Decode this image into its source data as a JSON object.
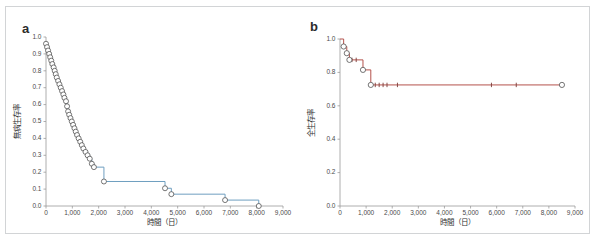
{
  "figure": {
    "panels": [
      {
        "letter": "a",
        "xlabel": "時間（日）",
        "ylabel": "無病生存率"
      },
      {
        "letter": "b",
        "xlabel": "時間（日）",
        "ylabel": "全生存率"
      }
    ]
  },
  "colors": {
    "panel_a_curve": "#6f9fc0",
    "panel_b_curve": "#b4524c",
    "axis": "#9a9a9a",
    "marker_edge": "#4a4a4a",
    "card_border": "#d2d4d6",
    "background": "#ffffff"
  },
  "chart_data": [
    {
      "type": "line",
      "title": "a",
      "subtitle": "Kaplan-Meier disease-free survival curve",
      "xlabel": "時間（日）",
      "ylabel": "無病生存率",
      "xlim": [
        0,
        9000
      ],
      "ylim": [
        0.0,
        1.0
      ],
      "xticks": [
        0,
        1000,
        2000,
        3000,
        4000,
        5000,
        6000,
        7000,
        8000,
        9000
      ],
      "xticklabels": [
        "0",
        "1,000",
        "2,000",
        "3,000",
        "4,000",
        "5,000",
        "6,000",
        "7,000",
        "8,000",
        "9,000"
      ],
      "yticks": [
        0.0,
        0.1,
        0.2,
        0.3,
        0.4,
        0.5,
        0.6,
        0.7,
        0.8,
        0.9,
        1.0
      ],
      "yticklabels": [
        "0.0",
        "0.1",
        "0.2",
        "0.3",
        "0.4",
        "0.5",
        "0.6",
        "0.7",
        "0.8",
        "0.9",
        "1.0"
      ],
      "grid": false,
      "legend": "none",
      "series": [
        {
          "name": "無病生存率",
          "color": "#6f9fc0",
          "marker": "open-circle",
          "x": [
            0,
            40,
            80,
            120,
            160,
            200,
            240,
            290,
            330,
            370,
            410,
            460,
            510,
            560,
            610,
            660,
            700,
            760,
            800,
            840,
            880,
            930,
            980,
            1030,
            1080,
            1130,
            1180,
            1240,
            1300,
            1360,
            1420,
            1500,
            1580,
            1660,
            1740,
            1820,
            2200,
            4520,
            4760,
            6800,
            8080
          ],
          "y": [
            0.96,
            0.94,
            0.92,
            0.9,
            0.88,
            0.86,
            0.84,
            0.82,
            0.8,
            0.78,
            0.76,
            0.74,
            0.72,
            0.7,
            0.68,
            0.66,
            0.64,
            0.62,
            0.59,
            0.56,
            0.54,
            0.52,
            0.5,
            0.48,
            0.46,
            0.44,
            0.42,
            0.4,
            0.38,
            0.36,
            0.34,
            0.32,
            0.3,
            0.28,
            0.25,
            0.23,
            0.145,
            0.105,
            0.07,
            0.035,
            0.0
          ]
        }
      ]
    },
    {
      "type": "line",
      "title": "b",
      "subtitle": "Kaplan-Meier overall survival curve",
      "xlabel": "時間（日）",
      "ylabel": "全生存率",
      "xlim": [
        0,
        9000
      ],
      "ylim": [
        0.0,
        1.0
      ],
      "xticks": [
        0,
        1000,
        2000,
        3000,
        4000,
        5000,
        6000,
        7000,
        8000,
        9000
      ],
      "xticklabels": [
        "0",
        "1,000",
        "2,000",
        "3,000",
        "4,000",
        "5,000",
        "6,000",
        "7,000",
        "8,000",
        "9,000"
      ],
      "yticks": [
        0.0,
        0.2,
        0.4,
        0.6,
        0.8,
        1.0
      ],
      "yticklabels": [
        "0.0",
        "0.2",
        "0.4",
        "0.6",
        "0.8",
        "1.0"
      ],
      "grid": false,
      "legend": "none",
      "series": [
        {
          "name": "全生存率",
          "color": "#b4524c",
          "marker": "open-circle",
          "x": [
            0,
            140,
            260,
            360,
            880,
            1180,
            8500
          ],
          "y": [
            1.0,
            0.955,
            0.915,
            0.875,
            0.815,
            0.725,
            0.725
          ],
          "censor_x": [
            460,
            620,
            1350,
            1500,
            1650,
            1800,
            2200,
            5800,
            6750,
            8500
          ],
          "censor_y": [
            0.875,
            0.875,
            0.725,
            0.725,
            0.725,
            0.725,
            0.725,
            0.725,
            0.725,
            0.725
          ]
        }
      ]
    }
  ]
}
